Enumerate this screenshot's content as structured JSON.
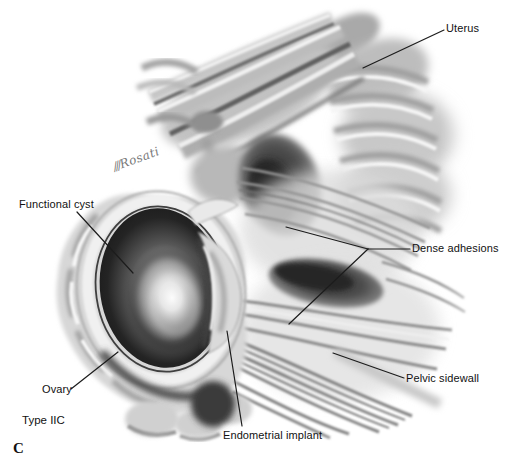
{
  "figure": {
    "panel_letter": "C",
    "type_label": "Type IIC",
    "signature_flourish": "///",
    "signature": "Rosati",
    "labels": {
      "uterus": "Uterus",
      "functional_cyst": "Functional cyst",
      "dense_adhesions": "Dense adhesions",
      "pelvic_sidewall": "Pelvic sidewall",
      "ovary": "Ovary",
      "endometrial_implant": "Endometrial implant"
    },
    "colors": {
      "background": "#ffffff",
      "label_text": "#111111",
      "leader_line": "#1c1c1c"
    }
  }
}
